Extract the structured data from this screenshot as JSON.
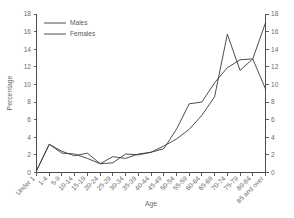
{
  "chart_data": {
    "type": "line",
    "title": "",
    "xlabel": "Age",
    "ylabel": "Percentage",
    "ylabel_right": "",
    "ylim": [
      0,
      18
    ],
    "ytick_step": 2,
    "yticks": [
      0,
      2,
      4,
      6,
      8,
      10,
      12,
      14,
      16,
      18
    ],
    "yticks_right": [
      0,
      2,
      4,
      6,
      8,
      10,
      12,
      14,
      16,
      18
    ],
    "grid": false,
    "legend_position": "top-left",
    "dual_axis": true,
    "categories": [
      "Under 1",
      "1-4",
      "5-9",
      "10-14",
      "15-19",
      "20-24",
      "25-29",
      "30-34",
      "35-39",
      "40-44",
      "45-49",
      "50-54",
      "55-59",
      "60-64",
      "65-69",
      "70-74",
      "75-79",
      "80-84",
      "85 and over"
    ],
    "series": [
      {
        "name": "Males",
        "color": "#3a3a3a",
        "values": [
          0.2,
          3.2,
          2.4,
          1.9,
          2.2,
          1.0,
          1.1,
          2.1,
          2.0,
          2.3,
          3.0,
          3.8,
          4.9,
          6.5,
          8.6,
          15.7,
          11.6,
          12.9,
          17.0
        ]
      },
      {
        "name": "Females",
        "color": "#3a3a3a",
        "values": [
          0.2,
          3.2,
          2.2,
          2.1,
          1.6,
          1.0,
          1.8,
          1.6,
          2.1,
          2.3,
          2.7,
          4.9,
          7.8,
          8.0,
          10.2,
          11.9,
          12.8,
          12.9,
          9.5
        ]
      }
    ]
  },
  "legend": {
    "items": [
      {
        "label": "Males"
      },
      {
        "label": "Females"
      }
    ]
  },
  "axes": {
    "y_left_title": "Percentage",
    "x_title": "Age"
  }
}
